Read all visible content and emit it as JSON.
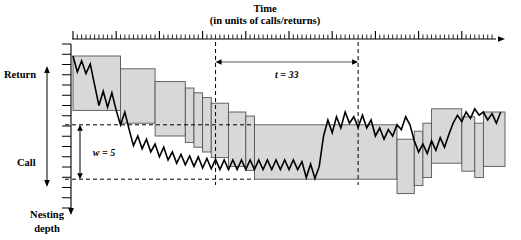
{
  "figure": {
    "title_line1": "Time",
    "title_line2": "(in units of calls/returns)",
    "y_axis_caption_line1": "Nesting",
    "y_axis_caption_line2": "depth",
    "y_axis_top_label": "Return",
    "y_axis_bottom_label": "Call",
    "window_label": "w = 5",
    "interval_label": "t = 33",
    "colors": {
      "band_fill": "#d8d8d8",
      "band_stroke": "#555555",
      "trace": "#000000",
      "axis": "#000000",
      "dashed": "#000000"
    }
  },
  "chart_data": {
    "type": "line",
    "title": "Time (in units of calls/returns)",
    "xlabel": "Time (in units of calls/returns)",
    "ylabel": "Nesting depth",
    "grid": false,
    "legend": null,
    "annotations": [
      {
        "text": "t = 33",
        "kind": "horizontal-span",
        "x_from": 33,
        "x_to": 66,
        "value": 33
      },
      {
        "text": "w = 5",
        "kind": "vertical-span",
        "value": 5
      },
      {
        "text": "Return",
        "kind": "axis-direction",
        "position": "up"
      },
      {
        "text": "Call",
        "kind": "axis-direction",
        "position": "down"
      }
    ],
    "axis": {
      "x_tick_minor_step": 1,
      "x_tick_major_step": 10,
      "x_tick_count": 100,
      "y_tick_count": 16,
      "y_inverted": true,
      "y_label_top": "Return",
      "y_label_bottom": "Call"
    },
    "series": [
      {
        "name": "nesting depth (call/return trace)",
        "x": [
          0,
          1,
          2,
          3,
          4,
          5,
          6,
          7,
          8,
          9,
          10,
          11,
          12,
          13,
          14,
          15,
          16,
          17,
          18,
          19,
          20,
          21,
          22,
          23,
          24,
          25,
          26,
          27,
          28,
          29,
          30,
          31,
          32,
          33,
          34,
          35,
          36,
          37,
          38,
          39,
          40,
          41,
          42,
          43,
          44,
          45,
          46,
          47,
          48,
          49,
          50,
          51,
          52,
          53,
          54,
          55,
          56,
          57,
          58,
          59,
          60,
          61,
          62,
          63,
          64,
          65,
          66,
          67,
          68,
          69,
          70,
          71,
          72,
          73,
          74,
          75,
          76,
          77,
          78,
          79,
          80,
          81,
          82,
          83,
          84,
          85,
          86,
          87,
          88,
          89,
          90,
          91,
          92,
          93,
          94,
          95,
          96,
          97,
          98,
          99
        ],
        "y": [
          1,
          3,
          1.6,
          3.2,
          2,
          4.6,
          7.2,
          5.4,
          7.4,
          5.6,
          7.8,
          9.6,
          8.0,
          10.2,
          12.2,
          11.0,
          12.6,
          11.4,
          13.0,
          12.0,
          13.6,
          12.4,
          14.0,
          13.0,
          14.4,
          13.3,
          14.6,
          13.5,
          14.8,
          13.6,
          15.0,
          13.8,
          15.1,
          13.9,
          15.2,
          14.0,
          15.2,
          14.0,
          15.2,
          14.0,
          15.2,
          14.0,
          15.2,
          14.0,
          15.2,
          14.0,
          15.2,
          14.0,
          15.2,
          14.0,
          15.2,
          14.0,
          15.2,
          14.2,
          16.2,
          14.5,
          16.3,
          14.8,
          11.0,
          9.0,
          10.6,
          8.6,
          10.0,
          8.0,
          9.4,
          8.6,
          9.9,
          8.4,
          10.0,
          9.0,
          11.0,
          10.0,
          11.4,
          10.2,
          11.0,
          9.6,
          10.2,
          8.6,
          9.6,
          11.6,
          13.0,
          12.0,
          13.2,
          11.6,
          12.8,
          11.2,
          12.4,
          10.8,
          9.4,
          8.4,
          9.2,
          8.0,
          8.8,
          7.6,
          8.4,
          8.0,
          9.0,
          8.2,
          9.4,
          8.0
        ]
      }
    ],
    "bands": [
      {
        "x_from": 0,
        "x_to": 11,
        "top": 1.0,
        "bottom": 7.8
      },
      {
        "x_from": 11,
        "x_to": 19,
        "top": 2.6,
        "bottom": 9.4
      },
      {
        "x_from": 19,
        "x_to": 26,
        "top": 4.2,
        "bottom": 11.0
      },
      {
        "x_from": 26,
        "x_to": 28,
        "top": 5.0,
        "bottom": 11.8
      },
      {
        "x_from": 28,
        "x_to": 30,
        "top": 5.6,
        "bottom": 12.4
      },
      {
        "x_from": 30,
        "x_to": 32,
        "top": 6.2,
        "bottom": 13.0
      },
      {
        "x_from": 32,
        "x_to": 36,
        "top": 6.9,
        "bottom": 13.7
      },
      {
        "x_from": 36,
        "x_to": 40,
        "top": 8.0,
        "bottom": 14.8
      },
      {
        "x_from": 40,
        "x_to": 42,
        "top": 8.5,
        "bottom": 15.3
      },
      {
        "x_from": 42,
        "x_to": 75,
        "top": 9.6,
        "bottom": 16.4
      },
      {
        "x_from": 75,
        "x_to": 79,
        "top": 11.4,
        "bottom": 18.2
      },
      {
        "x_from": 79,
        "x_to": 81,
        "top": 10.4,
        "bottom": 17.2
      },
      {
        "x_from": 81,
        "x_to": 83,
        "top": 9.4,
        "bottom": 16.2
      },
      {
        "x_from": 83,
        "x_to": 90,
        "top": 7.6,
        "bottom": 14.4
      },
      {
        "x_from": 90,
        "x_to": 93,
        "top": 8.6,
        "bottom": 15.4
      },
      {
        "x_from": 93,
        "x_to": 95,
        "top": 9.4,
        "bottom": 16.2
      },
      {
        "x_from": 95,
        "x_to": 100,
        "top": 8.0,
        "bottom": 14.8
      }
    ]
  }
}
